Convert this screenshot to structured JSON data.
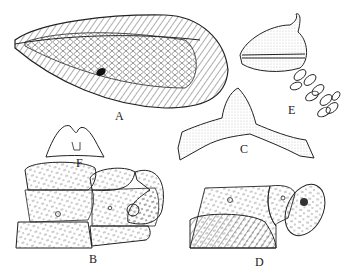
{
  "figure": {
    "panels": [
      {
        "id": "A",
        "label": "A",
        "subject": "forewing"
      },
      {
        "id": "B",
        "label": "B",
        "subject": "male terminalia, lateral view"
      },
      {
        "id": "C",
        "label": "C",
        "subject": "sclerite (gonarcus), dorsal view"
      },
      {
        "id": "D",
        "label": "D",
        "subject": "female terminalia, lateral view"
      },
      {
        "id": "E",
        "label": "E",
        "subject": "spermatheca with coiled duct"
      },
      {
        "id": "F",
        "label": "F",
        "subject": "small bilobed sclerite"
      }
    ],
    "colors": {
      "ink": "#222222",
      "background": "#ffffff",
      "stipple": "#888888"
    }
  }
}
